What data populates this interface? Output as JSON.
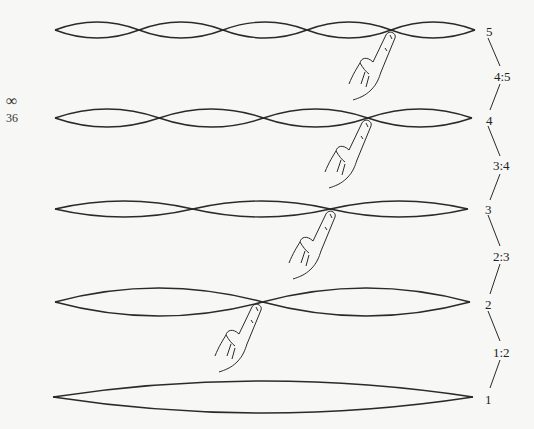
{
  "page_marker": {
    "symbol": "∞",
    "number": "36"
  },
  "strings": [
    {
      "harmonic": "5",
      "y": 30,
      "x0": 55,
      "x1": 475,
      "loops": 5,
      "amp": 8,
      "finger_x": 391
    },
    {
      "harmonic": "4",
      "y": 118,
      "x0": 55,
      "x1": 472,
      "loops": 4,
      "amp": 9,
      "finger_x": 367
    },
    {
      "harmonic": "3",
      "y": 209,
      "x0": 55,
      "x1": 468,
      "loops": 3,
      "amp": 8,
      "finger_x": 331
    },
    {
      "harmonic": "2",
      "y": 302,
      "x0": 55,
      "x1": 470,
      "loops": 2,
      "amp": 14,
      "finger_x": 257
    },
    {
      "harmonic": "1",
      "y": 397,
      "x0": 53,
      "x1": 473,
      "loops": 1,
      "amp": 16,
      "finger_x": null
    }
  ],
  "labels": {
    "h5": "5",
    "h4": "4",
    "h3": "3",
    "h2": "2",
    "h1": "1",
    "r45": "4:5",
    "r34": "3:4",
    "r23": "2:3",
    "r12": "1:2"
  },
  "colors": {
    "line": "#2a2a2a",
    "background": "#f7f7f6"
  }
}
